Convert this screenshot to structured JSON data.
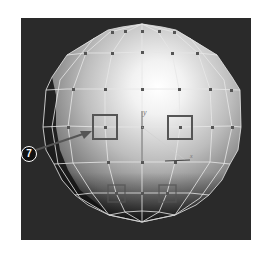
{
  "viewport": {
    "background": "#2a2a2a",
    "object": "polygon-sphere",
    "wire_color": "#e8e8e8",
    "vertex_color": "#555555",
    "selection_color": "#555555"
  },
  "axis": {
    "y_label": "y",
    "x_label": "x"
  },
  "callout": {
    "number": "7",
    "target": "selected-vertex-upper-left"
  },
  "selected_vertices": [
    {
      "name": "upper-left",
      "x": 105,
      "y": 127,
      "size": 24
    },
    {
      "name": "upper-right",
      "x": 180,
      "y": 127,
      "size": 24
    },
    {
      "name": "lower-left",
      "x": 116,
      "y": 193,
      "size": 17
    },
    {
      "name": "lower-right",
      "x": 167,
      "y": 193,
      "size": 17
    }
  ]
}
